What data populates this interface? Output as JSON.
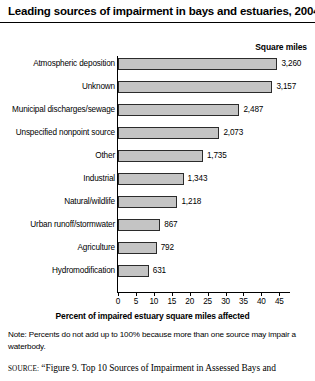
{
  "chart_data": {
    "type": "bar",
    "orientation": "horizontal",
    "title": "Leading sources of impairment in bays and estuaries, 2004",
    "xlabel": "Percent of impaired estuary square miles affected",
    "ylabel": "",
    "value_header": "Square miles",
    "xlim": [
      0,
      48
    ],
    "xticks": [
      "0",
      "5",
      "10",
      "15",
      "20",
      "25",
      "30",
      "35",
      "40",
      "45"
    ],
    "xtick_values": [
      0,
      5,
      10,
      15,
      20,
      25,
      30,
      35,
      40,
      45
    ],
    "grid": false,
    "legend": "none",
    "categories": [
      "Atmospheric deposition",
      "Unknown",
      "Municipal discharges/sewage",
      "Unspecified nonpoint source",
      "Other",
      "Industrial",
      "Natural/wildlife",
      "Urban runoff/stormwater",
      "Agriculture",
      "Hydromodification"
    ],
    "values": [
      44.5,
      43.1,
      33.9,
      28.3,
      23.7,
      18.3,
      16.6,
      11.8,
      10.8,
      8.6
    ],
    "value_labels": [
      "3,260",
      "3,157",
      "2,487",
      "2,073",
      "1,735",
      "1,343",
      "1,218",
      "867",
      "792",
      "631"
    ],
    "square_miles": [
      3260,
      3157,
      2487,
      2073,
      1735,
      1343,
      1218,
      867,
      792,
      631
    ],
    "bar_fill_color": "#c4c4c4",
    "bar_border_color": "#2b2b2b"
  },
  "note": "Note: Percents do not add up to 100% because more than one source may impair a waterbody.",
  "source": {
    "prefix": "SOURCE:",
    "text": "“Figure 9. Top 10 Sources of Impairment in Assessed Bays and"
  }
}
